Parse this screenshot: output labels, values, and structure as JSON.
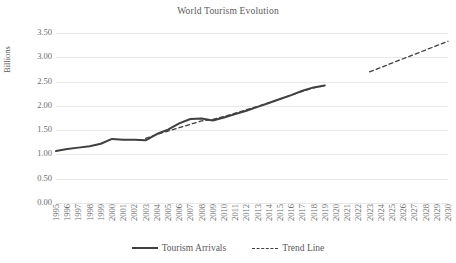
{
  "chart_data": {
    "type": "line",
    "title": "World Tourism Evolution",
    "xlabel": "",
    "ylabel": "Billions",
    "ylim": [
      0.0,
      3.5
    ],
    "ytick_labels": [
      "3.50",
      "3.00",
      "2.50",
      "2.00",
      "1.50",
      "1.00",
      "0.50",
      "0.00"
    ],
    "ytick_values": [
      3.5,
      3.0,
      2.5,
      2.0,
      1.5,
      1.0,
      0.5,
      0.0
    ],
    "grid": true,
    "legend_position": "bottom",
    "categories": [
      "1995",
      "1996",
      "1997",
      "1998",
      "1999",
      "2000",
      "2001",
      "2002",
      "2003",
      "2004",
      "2005",
      "2006",
      "2007",
      "2008",
      "2009",
      "2010",
      "2011",
      "2012",
      "2013",
      "2014",
      "2015",
      "2016",
      "2017",
      "2018",
      "2019",
      "2020",
      "2021",
      "2022",
      "2023",
      "2024",
      "2025",
      "2026",
      "2027",
      "2028",
      "2029",
      "2030"
    ],
    "series": [
      {
        "name": "Tourism Arrivals",
        "style": "solid",
        "color": "#404040",
        "values": [
          1.07,
          1.11,
          1.14,
          1.17,
          1.22,
          1.32,
          1.3,
          1.3,
          1.29,
          1.42,
          1.51,
          1.64,
          1.73,
          1.74,
          1.7,
          1.76,
          1.83,
          1.9,
          1.98,
          2.06,
          2.14,
          2.22,
          2.31,
          2.38,
          2.42,
          null,
          null,
          null,
          null,
          null,
          null,
          null,
          null,
          null,
          null,
          null
        ]
      },
      {
        "name": "Trend Line",
        "style": "dashed",
        "color": "#404040",
        "values": [
          null,
          null,
          null,
          null,
          null,
          null,
          null,
          null,
          1.33,
          1.41,
          1.48,
          1.55,
          1.62,
          1.69,
          1.72,
          1.78,
          1.85,
          1.92,
          1.99,
          2.06,
          2.14,
          2.22,
          2.3,
          2.37,
          2.42,
          null,
          null,
          null,
          2.7,
          2.79,
          2.88,
          2.97,
          3.06,
          3.15,
          3.24,
          3.33
        ]
      }
    ]
  },
  "legend": {
    "entries": [
      {
        "label": "Tourism Arrivals",
        "style": "solid"
      },
      {
        "label": "Trend Line",
        "style": "dashed"
      }
    ]
  }
}
